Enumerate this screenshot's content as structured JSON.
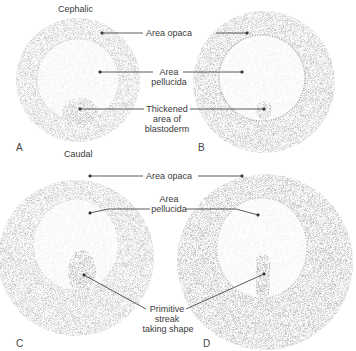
{
  "figure": {
    "orientation": {
      "top": "Cephalic",
      "bottom": "Caudal"
    },
    "panels": [
      {
        "letter": "A"
      },
      {
        "letter": "B"
      },
      {
        "letter": "C"
      },
      {
        "letter": "D"
      }
    ],
    "labels": {
      "top_row": {
        "area_opaca": "Area opaca",
        "area_pellucida_1": "Area",
        "area_pellucida_2": "pellucida",
        "thickened_1": "Thickened",
        "thickened_2": "area of",
        "thickened_3": "blastoderm"
      },
      "bottom_row": {
        "area_opaca": "Area opaca",
        "area_pellucida_1": "Area",
        "area_pellucida_2": "pellucida",
        "streak_1": "Primitive",
        "streak_2": "streak",
        "streak_3": "taking shape"
      }
    },
    "colors": {
      "stipple": "#9a9a9a",
      "leader_line": "#333333",
      "text": "#3a3a3a"
    }
  }
}
